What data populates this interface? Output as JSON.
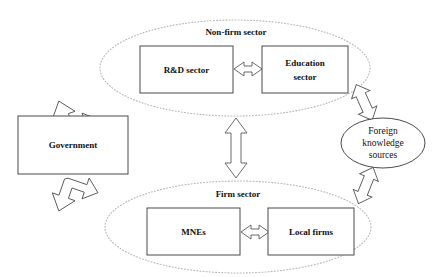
{
  "diagram": {
    "background_color": "#ffffff",
    "box_stroke_color": "#4a4a4a",
    "sector_stroke_color": "#b9b9b9",
    "arrow_fill_color": "#ffffff",
    "arrow_stroke_color": "#5a5a5a",
    "text_color": "#111111"
  },
  "sectors": {
    "non_firm": {
      "label": "Non-firm sector",
      "style": "dotted-ellipse",
      "members": [
        "R&D sector",
        "Education sector"
      ]
    },
    "firm": {
      "label": "Firm sector",
      "style": "dotted-ellipse",
      "members": [
        "MNEs",
        "Local firms"
      ]
    }
  },
  "nodes": {
    "rnd_sector": {
      "label": "R&D sector",
      "shape": "rectangle"
    },
    "education_sector": {
      "label_line1": "Education",
      "label_line2": "sector",
      "shape": "rectangle"
    },
    "government": {
      "label": "Government",
      "shape": "rectangle"
    },
    "mnes": {
      "label": "MNEs",
      "shape": "rectangle"
    },
    "local_firms": {
      "label": "Local firms",
      "shape": "rectangle"
    },
    "foreign_knowledge": {
      "label_line1": "Foreign",
      "label_line2": "knowledge",
      "label_line3": "sources",
      "shape": "ellipse"
    }
  },
  "connectors": [
    {
      "name": "rnd-education",
      "from": "R&D sector",
      "to": "Education sector",
      "style": "double-headed",
      "orientation": "horizontal"
    },
    {
      "name": "mnes-local-firms",
      "from": "MNEs",
      "to": "Local firms",
      "style": "double-headed",
      "orientation": "horizontal"
    },
    {
      "name": "non-firm-firm",
      "from": "Non-firm sector",
      "to": "Firm sector",
      "style": "double-headed",
      "orientation": "vertical"
    },
    {
      "name": "government-non-firm",
      "from": "Government",
      "to": "Non-firm sector",
      "style": "double-headed",
      "orientation": "diagonal-up-right"
    },
    {
      "name": "government-firm",
      "from": "Government",
      "to": "Firm sector",
      "style": "double-headed",
      "orientation": "diagonal-down-right"
    },
    {
      "name": "non-firm-foreign",
      "from": "Non-firm sector",
      "to": "Foreign knowledge sources",
      "style": "double-headed",
      "orientation": "diagonal-down-right"
    },
    {
      "name": "foreign-firm",
      "from": "Foreign knowledge sources",
      "to": "Firm sector",
      "style": "double-headed",
      "orientation": "diagonal-down-left"
    }
  ]
}
